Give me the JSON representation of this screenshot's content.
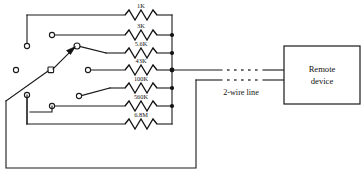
{
  "diagram": {
    "colors": {
      "wire": "#1a1a1a",
      "background": "#ffffff",
      "junction": "#111111",
      "text": "#111111"
    },
    "resistors": [
      {
        "label": "1K",
        "row": 1
      },
      {
        "label": "3K",
        "row": 2
      },
      {
        "label": "5.6K",
        "row": 3
      },
      {
        "label": "43K",
        "row": 4
      },
      {
        "label": "100K",
        "row": 5
      },
      {
        "label": "560K",
        "row": 6
      },
      {
        "label": "6.8M",
        "row": 7
      }
    ],
    "labels": {
      "two_wire_line": "2-wire line"
    },
    "remote_device": {
      "line1": "Remote",
      "line2": "device"
    }
  }
}
